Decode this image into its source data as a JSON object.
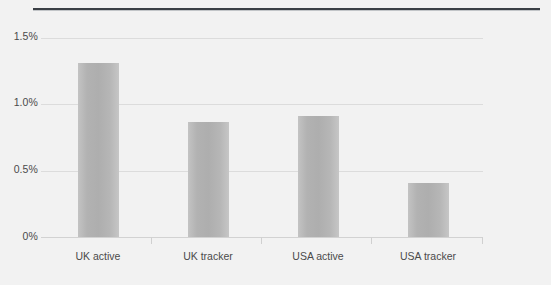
{
  "chart_data": {
    "type": "bar",
    "title": "",
    "subtitle": "",
    "xlabel": "",
    "ylabel": "",
    "categories": [
      "UK active",
      "UK tracker",
      "USA active",
      "USA tracker"
    ],
    "values": [
      1.31,
      0.87,
      0.91,
      0.41
    ],
    "value_labels": [
      "1.31%",
      "0.87%",
      "0.91%",
      "0.41%"
    ],
    "ylim": [
      0,
      1.5
    ],
    "ytick_labels": [
      "1.5%",
      "1.0%",
      "0.5%",
      "0%"
    ],
    "ytick_values": [
      1.5,
      1.0,
      0.5,
      0
    ],
    "grid": true,
    "grid_axis": "y",
    "legend": false,
    "legend_position": "none",
    "series": [
      {
        "name": "",
        "values": [
          1.31,
          0.87,
          0.91,
          0.41
        ]
      }
    ],
    "annotations": []
  },
  "colors": {
    "background": "#f2f2f2",
    "bar_fill": "#b5b5b5",
    "bar_edge_light": "#c6c6c6",
    "gridline": "#dcdcdc",
    "axis_line": "#d2d2d2",
    "tick_label": "#4a4a4a",
    "top_rule": "#3a3f45"
  },
  "axes": {
    "y": {
      "ticks": [
        {
          "label": "1.5%",
          "value": 1.5
        },
        {
          "label": "1.0%",
          "value": 1.0
        },
        {
          "label": "0.5%",
          "value": 0.5
        },
        {
          "label": "0%",
          "value": 0
        }
      ]
    },
    "x": {
      "ticks": [
        {
          "label": "UK active"
        },
        {
          "label": "UK tracker"
        },
        {
          "label": "USA active"
        },
        {
          "label": "USA tracker"
        }
      ]
    }
  }
}
